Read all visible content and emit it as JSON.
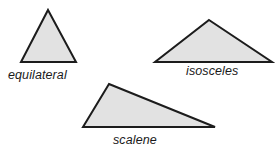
{
  "figure": {
    "background_color": "#ffffff",
    "shape_fill_color": "#e2e2e2",
    "shape_stroke_color": "#1c1c1c",
    "label_color": "#1a1a1a",
    "stroke_width": 2
  },
  "chart_data": {
    "type": "diagram",
    "title": "",
    "shapes": [
      {
        "name": "equilateral",
        "label": "equilateral",
        "kind": "triangle",
        "points": "48,10 76,62 21,62",
        "vertices": [
          [
            48,
            10
          ],
          [
            76,
            62
          ],
          [
            21,
            62
          ]
        ]
      },
      {
        "name": "isosceles",
        "label": "isosceles",
        "kind": "triangle",
        "points": "209,20 272,62 155,62",
        "vertices": [
          [
            209,
            20
          ],
          [
            272,
            62
          ],
          [
            155,
            62
          ]
        ]
      },
      {
        "name": "scalene",
        "label": "scalene",
        "kind": "triangle",
        "points": "109,84 215,127 83,127",
        "vertices": [
          [
            109,
            84
          ],
          [
            215,
            127
          ],
          [
            83,
            127
          ]
        ]
      }
    ]
  },
  "labels": {
    "equilateral": "equilateral",
    "isosceles": "isosceles",
    "scalene": "scalene"
  }
}
